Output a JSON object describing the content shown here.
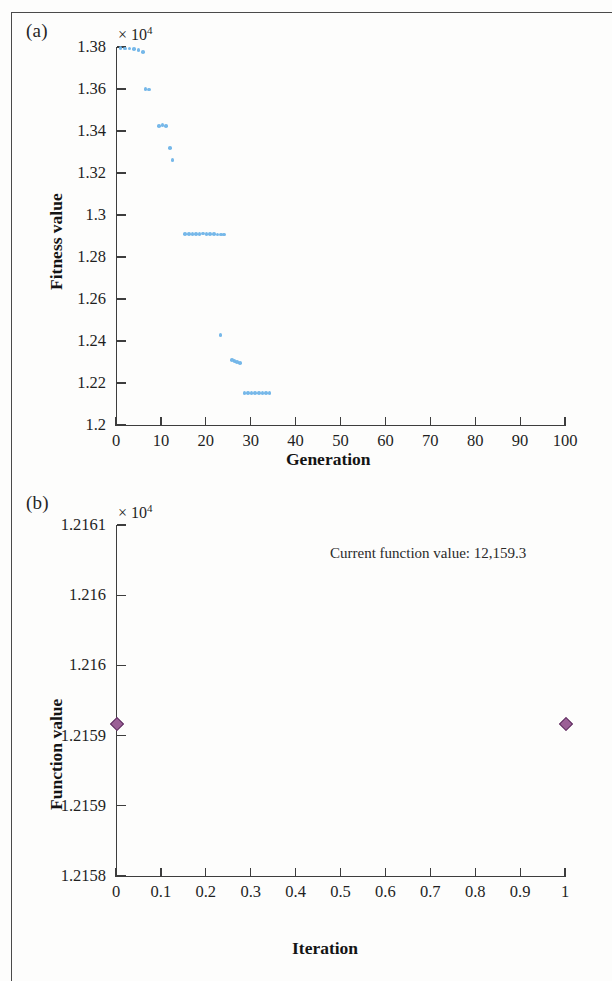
{
  "figure": {
    "panel_a_label": "(a)",
    "panel_b_label": "(b)",
    "marker_color_a": "#6fb4e8",
    "marker_color_b": "#9b5f96",
    "axis_color": "#3d3d3d"
  },
  "chart_data": [
    {
      "type": "scatter",
      "panel": "(a)",
      "title": "",
      "xlabel": "Generation",
      "ylabel": "Fitness value",
      "y_exponent_label": "× 10",
      "y_exponent_power": "4",
      "xlim": [
        0,
        100
      ],
      "ylim": [
        12000,
        13800
      ],
      "y_scale_factor": 10000,
      "grid": false,
      "legend": null,
      "xticks": [
        0,
        10,
        20,
        30,
        40,
        50,
        60,
        70,
        80,
        90,
        100
      ],
      "xticklabels": [
        "0",
        "10",
        "20",
        "30",
        "40",
        "50",
        "60",
        "70",
        "80",
        "90",
        "100"
      ],
      "yticks": [
        12000,
        12200,
        12400,
        12600,
        12800,
        13000,
        13200,
        13400,
        13600,
        13800
      ],
      "yticklabels": [
        "1.2",
        "1.22",
        "1.24",
        "1.26",
        "1.28",
        "1.3",
        "1.32",
        "1.34",
        "1.36",
        "1.38"
      ],
      "points": [
        {
          "x": 1,
          "y": 13795
        },
        {
          "x": 2,
          "y": 13793
        },
        {
          "x": 3,
          "y": 13792
        },
        {
          "x": 4,
          "y": 13790
        },
        {
          "x": 5,
          "y": 13785
        },
        {
          "x": 6,
          "y": 13775
        },
        {
          "x": 6.6,
          "y": 13600
        },
        {
          "x": 7.4,
          "y": 13598
        },
        {
          "x": 9.6,
          "y": 13425
        },
        {
          "x": 10.4,
          "y": 13428
        },
        {
          "x": 11.2,
          "y": 13424
        },
        {
          "x": 12.0,
          "y": 13320
        },
        {
          "x": 12.6,
          "y": 13262
        },
        {
          "x": 15.4,
          "y": 12910
        },
        {
          "x": 16.2,
          "y": 12910
        },
        {
          "x": 17.0,
          "y": 12910
        },
        {
          "x": 17.8,
          "y": 12910
        },
        {
          "x": 18.6,
          "y": 12910
        },
        {
          "x": 19.4,
          "y": 12912
        },
        {
          "x": 20.2,
          "y": 12910
        },
        {
          "x": 21.0,
          "y": 12910
        },
        {
          "x": 21.8,
          "y": 12910
        },
        {
          "x": 22.6,
          "y": 12908
        },
        {
          "x": 23.4,
          "y": 12908
        },
        {
          "x": 24.0,
          "y": 12908
        },
        {
          "x": 23.3,
          "y": 12428
        },
        {
          "x": 25.8,
          "y": 12310
        },
        {
          "x": 26.4,
          "y": 12305
        },
        {
          "x": 27.0,
          "y": 12300
        },
        {
          "x": 27.6,
          "y": 12295
        },
        {
          "x": 28.6,
          "y": 12152
        },
        {
          "x": 29.4,
          "y": 12152
        },
        {
          "x": 30.2,
          "y": 12152
        },
        {
          "x": 31.0,
          "y": 12152
        },
        {
          "x": 31.8,
          "y": 12152
        },
        {
          "x": 32.6,
          "y": 12152
        },
        {
          "x": 33.4,
          "y": 12152
        },
        {
          "x": 34.2,
          "y": 12152
        }
      ]
    },
    {
      "type": "scatter",
      "panel": "(b)",
      "title": "",
      "xlabel": "Iteration",
      "ylabel": "Function value",
      "y_exponent_label": "× 10",
      "y_exponent_power": "4",
      "annotation": "Current function value: 12,159.3",
      "xlim": [
        0,
        1
      ],
      "ylim": [
        12158,
        12161
      ],
      "y_scale_factor": 10000,
      "grid": false,
      "legend": null,
      "xticks": [
        0,
        0.1,
        0.2,
        0.3,
        0.4,
        0.5,
        0.6,
        0.7,
        0.8,
        0.9,
        1
      ],
      "xticklabels": [
        "0",
        "0.1",
        "0.2",
        "0.3",
        "0.4",
        "0.5",
        "0.6",
        "0.7",
        "0.8",
        "0.9",
        "1"
      ],
      "yticks": [
        12158,
        12158.6,
        12159.2,
        12159.8,
        12160.4,
        12161
      ],
      "yticklabels": [
        "1.2158",
        "1.2159",
        "1.2159",
        "1.216",
        "1.216",
        "1.2161"
      ],
      "points": [
        {
          "x": 0,
          "y": 12159.3
        },
        {
          "x": 1,
          "y": 12159.3
        }
      ]
    }
  ]
}
